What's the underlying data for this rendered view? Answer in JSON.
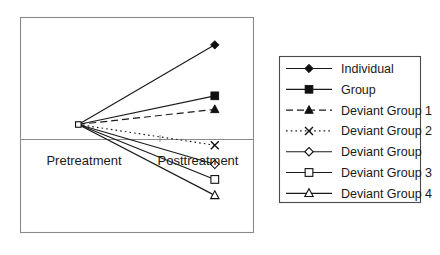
{
  "chart_data": {
    "type": "line",
    "title": "",
    "xlabel": "",
    "ylabel": "",
    "categories": [
      "Pretreatment",
      "Posttreatment"
    ],
    "x": [
      0,
      1
    ],
    "xlim": [
      -0.42,
      1.28
    ],
    "ylim": [
      -1.35,
      1.35
    ],
    "grid": false,
    "zero_axis": true,
    "legend_position": "right-outside",
    "tick_labels": {
      "x": [
        "Pretreatment",
        "Posttreatment"
      ],
      "y": []
    },
    "annotations": [
      {
        "text": "Pretreatment",
        "x": 0.0,
        "y": -0.26,
        "align": "center"
      },
      {
        "text": "Posttreatment",
        "x": 0.93,
        "y": -0.26,
        "align": "center"
      }
    ],
    "series": [
      {
        "name": "Individual",
        "values": [
          0,
          1.0
        ],
        "marker": "filled-diamond",
        "linestyle": "solid",
        "color": "#111111"
      },
      {
        "name": "Group",
        "values": [
          0,
          0.36
        ],
        "marker": "filled-square",
        "linestyle": "solid",
        "color": "#111111"
      },
      {
        "name": "Deviant Group 1",
        "values": [
          0,
          0.19
        ],
        "marker": "filled-triangle",
        "linestyle": "dashed",
        "color": "#111111"
      },
      {
        "name": "Deviant Group 2",
        "values": [
          0,
          -0.26
        ],
        "marker": "x-cross",
        "linestyle": "dotted",
        "color": "#111111"
      },
      {
        "name": "Deviant Group",
        "values": [
          0,
          -0.5
        ],
        "marker": "open-diamond",
        "linestyle": "solid",
        "color": "#111111"
      },
      {
        "name": "Deviant Group 3",
        "values": [
          0,
          -0.69
        ],
        "marker": "open-square",
        "linestyle": "solid",
        "color": "#111111"
      },
      {
        "name": "Deviant Group 4",
        "values": [
          0,
          -0.89
        ],
        "marker": "open-triangle",
        "linestyle": "solid",
        "color": "#111111"
      }
    ]
  },
  "plot": {
    "x_label_left": "Pretreatment",
    "x_label_right": "Posttreatment"
  },
  "legend": {
    "items": [
      {
        "label": "Individual",
        "marker": "filled-diamond",
        "linestyle": "solid"
      },
      {
        "label": "Group",
        "marker": "filled-square",
        "linestyle": "solid"
      },
      {
        "label": "Deviant Group 1",
        "marker": "filled-triangle",
        "linestyle": "dashed"
      },
      {
        "label": "Deviant Group 2",
        "marker": "x-cross",
        "linestyle": "dotted"
      },
      {
        "label": "Deviant Group",
        "marker": "open-diamond",
        "linestyle": "solid"
      },
      {
        "label": "Deviant Group 3",
        "marker": "open-square",
        "linestyle": "solid"
      },
      {
        "label": "Deviant Group 4",
        "marker": "open-triangle",
        "linestyle": "solid"
      }
    ]
  },
  "colors": {
    "ink": "#111111",
    "frame": "#8a8a8a",
    "legend_frame": "#4a4a4a",
    "background": "#ffffff"
  }
}
